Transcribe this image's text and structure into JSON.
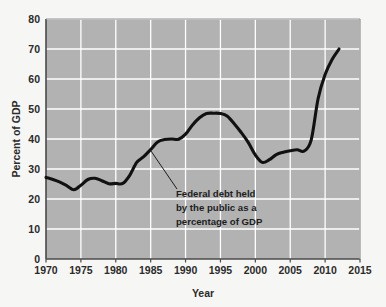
{
  "chart_data": {
    "type": "line",
    "title": "",
    "xlabel": "Year",
    "ylabel": "Percent of GDP",
    "xlim": [
      1970,
      2015
    ],
    "ylim": [
      0,
      80
    ],
    "grid": true,
    "legend": "none",
    "x_ticks": [
      "1970",
      "1975",
      "1980",
      "1985",
      "1990",
      "1995",
      "2000",
      "2005",
      "2010",
      "2015"
    ],
    "y_ticks": [
      "0",
      "10",
      "20",
      "30",
      "40",
      "50",
      "60",
      "70",
      "80"
    ],
    "series": [
      {
        "name": "Federal debt held by the public as a percentage of GDP",
        "color": "#111111",
        "x": [
          1970,
          1971,
          1972,
          1973,
          1974,
          1975,
          1976,
          1977,
          1978,
          1979,
          1980,
          1981,
          1982,
          1983,
          1984,
          1985,
          1986,
          1987,
          1988,
          1989,
          1990,
          1991,
          1992,
          1993,
          1994,
          1995,
          1996,
          1997,
          1998,
          1999,
          2000,
          2001,
          2002,
          2003,
          2004,
          2005,
          2006,
          2007,
          2008,
          2009,
          2010,
          2011,
          2012
        ],
        "values": [
          27.2,
          26.5,
          25.6,
          24.4,
          23.1,
          24.6,
          26.5,
          26.9,
          26.1,
          25.1,
          25.2,
          25.2,
          27.9,
          32.2,
          34.1,
          36.5,
          39.0,
          39.8,
          40.0,
          39.9,
          41.6,
          44.7,
          47.1,
          48.5,
          48.6,
          48.5,
          47.6,
          45.0,
          42.1,
          38.8,
          34.7,
          32.2,
          33.1,
          34.8,
          35.6,
          36.1,
          36.4,
          36.0,
          39.6,
          53.5,
          61.5,
          66.5,
          70.0
        ]
      }
    ],
    "annotations": [
      {
        "name": "series-callout",
        "lines": [
          "Federal debt held",
          "by the public as a",
          "percentage of GDP"
        ],
        "points_to_year": 1985,
        "points_to_value": 36.5
      }
    ],
    "colors": {
      "plot_background": "#b2b2b2",
      "gridline": "#ffffff",
      "axis": "#4a4a4a",
      "line": "#111111",
      "page_background": "#f6f6f4",
      "text": "#2b2b2b"
    }
  }
}
